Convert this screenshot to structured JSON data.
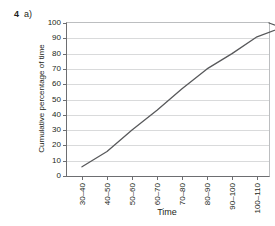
{
  "question": {
    "number": "4",
    "part": "a)"
  },
  "chart_data": {
    "type": "line",
    "title": "",
    "xlabel": "Time",
    "ylabel": "Cumulative percentage of time",
    "categories": [
      "30–40",
      "40–50",
      "50–60",
      "60–70",
      "70–80",
      "80–90",
      "90–100",
      "100–110",
      "110–120"
    ],
    "values": [
      6,
      16,
      30,
      43,
      57,
      70,
      80,
      91,
      97
    ],
    "series": [
      {
        "name": "Cumulative percentage of time",
        "values": [
          6,
          16,
          30,
          43,
          57,
          70,
          80,
          91,
          97
        ]
      }
    ],
    "ylim": [
      0,
      100
    ],
    "ytick_values": [
      0,
      10,
      20,
      30,
      40,
      50,
      60,
      70,
      80,
      90,
      100
    ],
    "ytick_labels": [
      "0",
      "10",
      "20",
      "30",
      "40",
      "50",
      "60",
      "70",
      "80",
      "90",
      "100"
    ],
    "grid": "horizontal",
    "legend": "none",
    "line_color": "#58595b"
  }
}
